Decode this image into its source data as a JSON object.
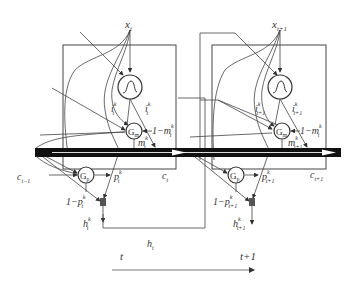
{
  "diagram": {
    "cells": [
      {
        "name": "cell-t",
        "input": "x",
        "input_sub": "t",
        "input_gate_left": "i",
        "input_gate_left_sub": "t",
        "input_gate_right": "i",
        "input_gate_right_sub": "t",
        "sup": "k",
        "gm": "G",
        "gm_sub": "m",
        "one_minus_m": "1−m",
        "one_minus_m_sub": "t",
        "m": "m",
        "m_sub": "t",
        "gp": "G",
        "gp_sub": "p",
        "p": "p",
        "p_sub": "t",
        "one_minus_p": "1−p",
        "one_minus_p_sub": "t",
        "h": "h",
        "h_sub": "t",
        "c_in": "c",
        "c_in_sub": "t−1",
        "c_out": "c",
        "c_out_sub": "t"
      },
      {
        "name": "cell-t1",
        "input": "x",
        "input_sub": "t+1",
        "input_gate_left": "i",
        "input_gate_left_sub": "t+1",
        "input_gate_right": "i",
        "input_gate_right_sub": "t+1",
        "sup": "k",
        "gm": "G",
        "gm_sub": "m",
        "one_minus_m": "1−m",
        "one_minus_m_sub": "t",
        "m": "m",
        "m_sub": "t+1",
        "gp": "G",
        "gp_sub": "p",
        "p": "p",
        "p_sub": "t+1",
        "one_minus_p": "1−p",
        "one_minus_p_sub": "t+1",
        "h": "h",
        "h_sub": "t+1",
        "c_out": "c",
        "c_out_sub": "t+1"
      }
    ],
    "hidden_between": "h",
    "hidden_between_sub": "t",
    "timeline": {
      "left": "t",
      "right": "t+1"
    }
  }
}
